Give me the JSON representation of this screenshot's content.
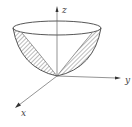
{
  "figure": {
    "type": "3d-paraboloid-surface",
    "axes": {
      "x_label": "x",
      "y_label": "y",
      "z_label": "z"
    },
    "colors": {
      "stroke": "#444444",
      "hatch": "#555555",
      "axis": "#666666",
      "background": "#ffffff"
    }
  }
}
